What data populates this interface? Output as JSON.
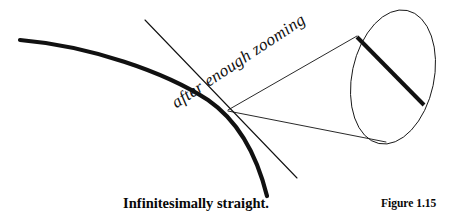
{
  "figure": {
    "annotation_label": "after enough zooming",
    "caption": "Infinitesimally straight.",
    "figure_number": "Figure 1.15",
    "ink_color": "#111111",
    "background_color": "#ffffff"
  },
  "chart_data": {
    "type": "line",
    "title": "Infinitesimally straight.",
    "subtitle": "Figure 1.15",
    "xlabel": "",
    "ylabel": "",
    "annotations": [
      {
        "text": "after enough zooming",
        "x": 178,
        "y": 94,
        "rotation_deg": -33.5,
        "style": "italic"
      }
    ],
    "legend": [],
    "grid": false,
    "xlim": [
      0,
      454
    ],
    "ylim": [
      222,
      0
    ],
    "series": [
      {
        "name": "curve",
        "role": "thick-concave-curve",
        "stroke_width": 4.2,
        "color": "#111111",
        "path": "M20,40 C90,46 165,72 208,100 C240,122 258,160 267,196"
      },
      {
        "name": "tangent-line",
        "role": "tangent-at-point-of-contact",
        "stroke_width": 1.1,
        "color": "#111111",
        "x": [
          145,
          297
        ],
        "y": [
          20,
          178
        ]
      },
      {
        "name": "cone-upper-line",
        "role": "magnifier-cone-edge",
        "stroke_width": 0.9,
        "color": "#111111",
        "x": [
          228,
          357
        ],
        "y": [
          110,
          36
        ]
      },
      {
        "name": "cone-lower-line",
        "role": "magnifier-cone-edge",
        "stroke_width": 0.9,
        "color": "#111111",
        "x": [
          228,
          386
        ],
        "y": [
          111,
          142
        ]
      },
      {
        "name": "magnifier-ellipse",
        "role": "zoomed-view-boundary",
        "stroke_width": 0.9,
        "color": "#111111",
        "center": [
          393,
          77
        ],
        "rx": 41,
        "ry": 68,
        "rotation_deg": 12
      },
      {
        "name": "magnified-chord",
        "role": "straight-segment-inside-magnifier",
        "stroke_width": 4.0,
        "color": "#111111",
        "x": [
          357,
          424
        ],
        "y": [
          37,
          105
        ]
      }
    ]
  }
}
